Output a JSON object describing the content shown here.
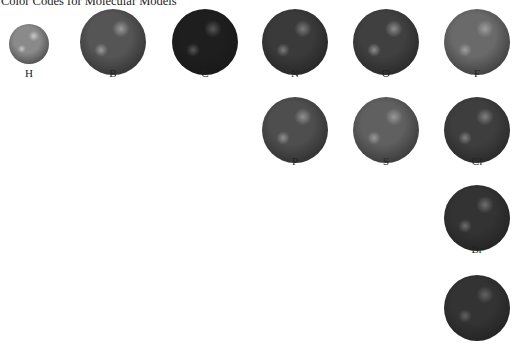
{
  "title": "Color Codes for Molecular Models",
  "atoms": [
    {
      "symbol": "H",
      "cx": 29,
      "cy": 44,
      "r": 20,
      "base": "#8a8a8a",
      "light": "#c8c8c8",
      "label_y": 67
    },
    {
      "symbol": "B",
      "cx": 113,
      "cy": 42,
      "r": 33,
      "base": "#555555",
      "light": "#9a9a9a",
      "label_y": 67
    },
    {
      "symbol": "C",
      "cx": 205,
      "cy": 42,
      "r": 33,
      "base": "#1e1e1e",
      "light": "#555555",
      "label_y": 67
    },
    {
      "symbol": "N",
      "cx": 295,
      "cy": 42,
      "r": 33,
      "base": "#3a3a3a",
      "light": "#7a7a7a",
      "label_y": 67
    },
    {
      "symbol": "O",
      "cx": 386,
      "cy": 42,
      "r": 33,
      "base": "#404040",
      "light": "#8c8c8c",
      "label_y": 67
    },
    {
      "symbol": "F",
      "cx": 477,
      "cy": 42,
      "r": 33,
      "base": "#6a6a6a",
      "light": "#9e9e9e",
      "label_y": 67
    },
    {
      "symbol": "P",
      "cx": 295,
      "cy": 130,
      "r": 33,
      "base": "#4e4e4e",
      "light": "#909090",
      "label_y": 155
    },
    {
      "symbol": "S",
      "cx": 386,
      "cy": 130,
      "r": 33,
      "base": "#606060",
      "light": "#989898",
      "label_y": 155
    },
    {
      "symbol": "Cl",
      "cx": 477,
      "cy": 130,
      "r": 33,
      "base": "#3e3e3e",
      "light": "#808080",
      "label_y": 155
    },
    {
      "symbol": "Br",
      "cx": 477,
      "cy": 218,
      "r": 33,
      "base": "#333333",
      "light": "#6e6e6e",
      "label_y": 243
    },
    {
      "symbol": "",
      "cx": 477,
      "cy": 308,
      "r": 33,
      "base": "#333333",
      "light": "#626262",
      "label_y": null
    }
  ]
}
